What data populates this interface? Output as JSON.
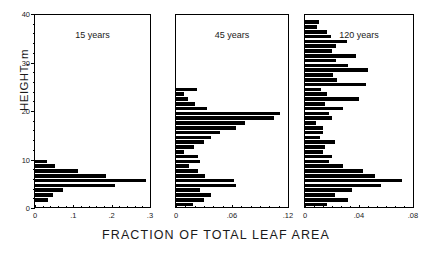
{
  "chart_data": {
    "type": "bar",
    "orientation": "horizontal",
    "title": "",
    "xlabel": "FRACTION OF TOTAL LEAF AREA",
    "ylabel": "HEIGHT, m",
    "ylim": [
      0,
      40
    ],
    "ytick_labels": [
      "0",
      "10",
      "20",
      "30",
      "40"
    ],
    "ytick_values": [
      0,
      10,
      20,
      30,
      40
    ],
    "grid": false,
    "legend": "none",
    "bin_height_m": 1,
    "panels": [
      {
        "label": "15 years",
        "xlim": [
          0,
          0.3
        ],
        "xtick_labels": [
          "0",
          ".1",
          ".2",
          ".3"
        ],
        "xtick_values": [
          0,
          0.1,
          0.2,
          0.3
        ],
        "bins": [
          {
            "height": 0.5,
            "value": 0.0
          },
          {
            "height": 1.5,
            "value": 0.035
          },
          {
            "height": 2.5,
            "value": 0.048
          },
          {
            "height": 3.5,
            "value": 0.072
          },
          {
            "height": 4.5,
            "value": 0.208
          },
          {
            "height": 5.5,
            "value": 0.289
          },
          {
            "height": 6.5,
            "value": 0.186
          },
          {
            "height": 7.5,
            "value": 0.112
          },
          {
            "height": 8.5,
            "value": 0.052
          },
          {
            "height": 9.5,
            "value": 0.03
          },
          {
            "height": 10.5,
            "value": 0.0
          }
        ]
      },
      {
        "label": "45 years",
        "xlim": [
          0,
          0.12
        ],
        "xtick_labels": [
          "0",
          ".06",
          ".12"
        ],
        "xtick_values": [
          0,
          0.06,
          0.12
        ],
        "bins": [
          {
            "height": 0.5,
            "value": 0.018
          },
          {
            "height": 1.5,
            "value": 0.03
          },
          {
            "height": 2.5,
            "value": 0.038
          },
          {
            "height": 3.5,
            "value": 0.026
          },
          {
            "height": 4.5,
            "value": 0.064
          },
          {
            "height": 5.5,
            "value": 0.062
          },
          {
            "height": 6.5,
            "value": 0.031
          },
          {
            "height": 7.5,
            "value": 0.024
          },
          {
            "height": 8.5,
            "value": 0.014
          },
          {
            "height": 9.5,
            "value": 0.026
          },
          {
            "height": 10.5,
            "value": 0.024
          },
          {
            "height": 11.5,
            "value": 0.009
          },
          {
            "height": 12.5,
            "value": 0.019
          },
          {
            "height": 13.5,
            "value": 0.03
          },
          {
            "height": 14.5,
            "value": 0.037
          },
          {
            "height": 15.5,
            "value": 0.047
          },
          {
            "height": 16.5,
            "value": 0.064
          },
          {
            "height": 17.5,
            "value": 0.074
          },
          {
            "height": 18.5,
            "value": 0.105
          },
          {
            "height": 19.5,
            "value": 0.111
          },
          {
            "height": 20.5,
            "value": 0.033
          },
          {
            "height": 21.5,
            "value": 0.02
          },
          {
            "height": 22.5,
            "value": 0.013
          },
          {
            "height": 23.5,
            "value": 0.009
          },
          {
            "height": 24.5,
            "value": 0.022
          },
          {
            "height": 25.5,
            "value": 0.0
          }
        ]
      },
      {
        "label": "120 years",
        "xlim": [
          0,
          0.08
        ],
        "xtick_labels": [
          "0",
          ".04",
          ".08"
        ],
        "xtick_values": [
          0,
          0.04,
          0.08
        ],
        "bins": [
          {
            "height": 0.5,
            "value": 0.016
          },
          {
            "height": 1.5,
            "value": 0.032
          },
          {
            "height": 2.5,
            "value": 0.022
          },
          {
            "height": 3.5,
            "value": 0.035
          },
          {
            "height": 4.5,
            "value": 0.056
          },
          {
            "height": 5.5,
            "value": 0.072
          },
          {
            "height": 6.5,
            "value": 0.052
          },
          {
            "height": 7.5,
            "value": 0.043
          },
          {
            "height": 8.5,
            "value": 0.028
          },
          {
            "height": 9.5,
            "value": 0.018
          },
          {
            "height": 10.5,
            "value": 0.02
          },
          {
            "height": 11.5,
            "value": 0.013
          },
          {
            "height": 12.5,
            "value": 0.015
          },
          {
            "height": 13.5,
            "value": 0.022
          },
          {
            "height": 14.5,
            "value": 0.011
          },
          {
            "height": 15.5,
            "value": 0.013
          },
          {
            "height": 16.5,
            "value": 0.013
          },
          {
            "height": 17.5,
            "value": 0.008
          },
          {
            "height": 18.5,
            "value": 0.02
          },
          {
            "height": 19.5,
            "value": 0.018
          },
          {
            "height": 20.5,
            "value": 0.028
          },
          {
            "height": 21.5,
            "value": 0.015
          },
          {
            "height": 22.5,
            "value": 0.04
          },
          {
            "height": 23.5,
            "value": 0.016
          },
          {
            "height": 24.5,
            "value": 0.012
          },
          {
            "height": 25.5,
            "value": 0.045
          },
          {
            "height": 26.5,
            "value": 0.024
          },
          {
            "height": 27.5,
            "value": 0.021
          },
          {
            "height": 28.5,
            "value": 0.047
          },
          {
            "height": 29.5,
            "value": 0.032
          },
          {
            "height": 30.5,
            "value": 0.023
          },
          {
            "height": 31.5,
            "value": 0.038
          },
          {
            "height": 32.5,
            "value": 0.02
          },
          {
            "height": 33.5,
            "value": 0.023
          },
          {
            "height": 34.5,
            "value": 0.031
          },
          {
            "height": 35.5,
            "value": 0.019
          },
          {
            "height": 36.5,
            "value": 0.016
          },
          {
            "height": 37.5,
            "value": 0.009
          },
          {
            "height": 38.5,
            "value": 0.01
          },
          {
            "height": 39.5,
            "value": 0.0
          }
        ]
      }
    ]
  }
}
